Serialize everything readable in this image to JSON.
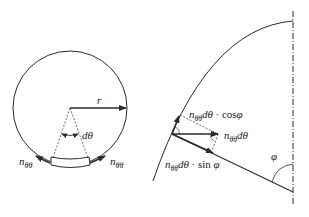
{
  "left_figure": {
    "radius_label": "r",
    "angle_label": "dθ",
    "force_label_left": {
      "main": "n",
      "sub": "θθ"
    },
    "force_label_right": {
      "main": "n",
      "sub": "θθ"
    }
  },
  "right_figure": {
    "component_cos": {
      "n": "n",
      "sub": "θθ",
      "rest": "dθ",
      "op": " · cos",
      "angle": "φ"
    },
    "component_total": {
      "n": "n",
      "sub": "θθ",
      "rest": "dθ"
    },
    "component_sin": {
      "n": "n",
      "sub": "θθ",
      "rest": "dθ",
      "op": " · sin ",
      "angle": "φ"
    },
    "angle_label": "φ"
  },
  "colors": {
    "line": "#2a2a2a",
    "background": "#ffffff"
  }
}
